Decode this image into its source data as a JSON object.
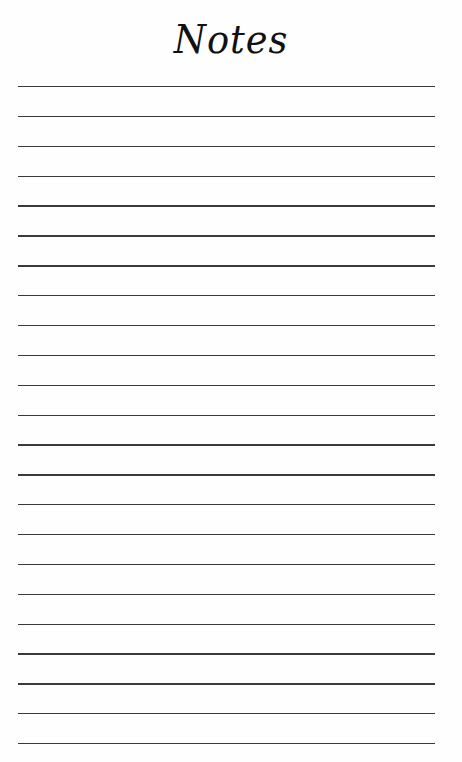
{
  "page": {
    "title": "Notes",
    "background_color": "#fefefe",
    "line_color": "#3a3a3a",
    "line_count": 23,
    "first_line_y": 86,
    "line_spacing": 29.86,
    "line_left": 18,
    "line_right": 435
  }
}
